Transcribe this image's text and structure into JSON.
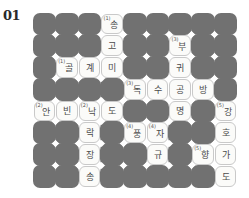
{
  "puzzle": {
    "number_label": "01",
    "rows": 8,
    "cols": 9,
    "colors": {
      "block": "#717171",
      "open_bg": "#fbfbf9",
      "open_border": "#c9c9c9",
      "text": "#4a4a4a"
    },
    "cells": [
      {
        "row": 0,
        "col": 3,
        "clue": "(1)",
        "text": "송"
      },
      {
        "row": 1,
        "col": 3,
        "clue": "",
        "text": "고"
      },
      {
        "row": 1,
        "col": 6,
        "clue": "(3)",
        "text": "부"
      },
      {
        "row": 2,
        "col": 1,
        "clue": "(1)",
        "text": "골"
      },
      {
        "row": 2,
        "col": 2,
        "clue": "",
        "text": "계"
      },
      {
        "row": 2,
        "col": 3,
        "clue": "",
        "text": "미"
      },
      {
        "row": 2,
        "col": 6,
        "clue": "",
        "text": "귀"
      },
      {
        "row": 3,
        "col": 4,
        "clue": "(3)",
        "text": "독"
      },
      {
        "row": 3,
        "col": 5,
        "clue": "",
        "text": "수"
      },
      {
        "row": 3,
        "col": 6,
        "clue": "",
        "text": "공"
      },
      {
        "row": 3,
        "col": 7,
        "clue": "",
        "text": "방"
      },
      {
        "row": 4,
        "col": 0,
        "clue": "(2)",
        "text": "안"
      },
      {
        "row": 4,
        "col": 1,
        "clue": "",
        "text": "빈"
      },
      {
        "row": 4,
        "col": 2,
        "clue": "(2)",
        "text": "낙"
      },
      {
        "row": 4,
        "col": 3,
        "clue": "",
        "text": "도"
      },
      {
        "row": 4,
        "col": 6,
        "clue": "",
        "text": "명"
      },
      {
        "row": 4,
        "col": 8,
        "clue": "(5)",
        "text": "강"
      },
      {
        "row": 5,
        "col": 2,
        "clue": "",
        "text": "락"
      },
      {
        "row": 5,
        "col": 4,
        "clue": "(4)",
        "text": "풍"
      },
      {
        "row": 5,
        "col": 5,
        "clue": "(4)",
        "text": "자"
      },
      {
        "row": 5,
        "col": 8,
        "clue": "",
        "text": "호"
      },
      {
        "row": 6,
        "col": 2,
        "clue": "",
        "text": "장"
      },
      {
        "row": 6,
        "col": 5,
        "clue": "",
        "text": "규"
      },
      {
        "row": 6,
        "col": 7,
        "clue": "(5)",
        "text": "향"
      },
      {
        "row": 6,
        "col": 8,
        "clue": "",
        "text": "가"
      },
      {
        "row": 7,
        "col": 2,
        "clue": "",
        "text": "송"
      },
      {
        "row": 7,
        "col": 8,
        "clue": "",
        "text": "도"
      }
    ]
  }
}
